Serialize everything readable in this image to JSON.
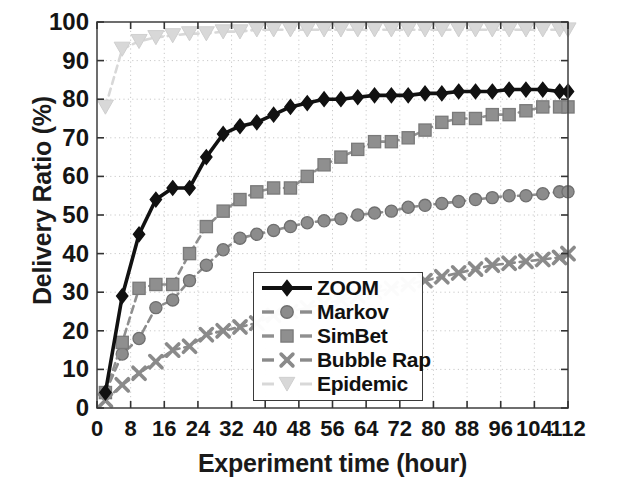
{
  "chart_data": {
    "type": "line",
    "title": "",
    "xlabel": "Experiment time (hour)",
    "ylabel": "Delivery Ratio (%)",
    "xlim": [
      0,
      112
    ],
    "ylim": [
      0,
      100
    ],
    "xticks": [
      0,
      8,
      16,
      24,
      32,
      40,
      48,
      56,
      64,
      72,
      80,
      88,
      96,
      104,
      112
    ],
    "yticks": [
      0,
      10,
      20,
      30,
      40,
      50,
      60,
      70,
      80,
      90,
      100
    ],
    "grid": true,
    "grid_style": "dotted",
    "legend_position": "lower center",
    "x": [
      2,
      6,
      10,
      14,
      18,
      22,
      26,
      30,
      34,
      38,
      42,
      46,
      50,
      54,
      58,
      62,
      66,
      70,
      74,
      78,
      82,
      86,
      90,
      94,
      98,
      102,
      106,
      110,
      112
    ],
    "series": [
      {
        "name": "ZOOM",
        "color": "#111111",
        "marker": "diamond",
        "line": "solid",
        "values": [
          4,
          29,
          45,
          54,
          57,
          57,
          65,
          71,
          73,
          74,
          76,
          78,
          79,
          80,
          80,
          80.5,
          81,
          81,
          81,
          81.5,
          81.5,
          82,
          82,
          82,
          82.5,
          82.5,
          82.5,
          82,
          82
        ]
      },
      {
        "name": "Markov",
        "color": "#8c8c8c",
        "marker": "circle",
        "line": "dashed",
        "values": [
          4,
          14,
          18,
          26,
          28,
          33,
          37,
          41,
          44,
          45,
          46,
          47,
          48,
          48.5,
          49,
          50,
          50.5,
          51,
          52,
          52.5,
          53,
          53.5,
          54,
          54.5,
          55,
          55,
          55.5,
          56,
          56
        ]
      },
      {
        "name": "SimBet",
        "color": "#8f8f8f",
        "marker": "square",
        "line": "dashed",
        "values": [
          4,
          17,
          31,
          32,
          32,
          40,
          47,
          51,
          54,
          56,
          57,
          57,
          60,
          63,
          65,
          67,
          69,
          69,
          70,
          72,
          74,
          75,
          75,
          76,
          76,
          77,
          78,
          78,
          78
        ]
      },
      {
        "name": "Bubble Rap",
        "color": "#8a8a8a",
        "marker": "x",
        "line": "dashed",
        "values": [
          2,
          6,
          9,
          12,
          15,
          16,
          19,
          20,
          21,
          22,
          24,
          25,
          26,
          27,
          28,
          29,
          30,
          31,
          32,
          33,
          34,
          35,
          36,
          37,
          37.5,
          38,
          38.5,
          39,
          40
        ]
      },
      {
        "name": "Epidemic",
        "color": "#d8d8d8",
        "marker": "triangle-down",
        "line": "dashed",
        "values": [
          78,
          93,
          95,
          96,
          96.5,
          97,
          97,
          97.5,
          97.5,
          98,
          98,
          98,
          98,
          98,
          98,
          98,
          98,
          98,
          98,
          98,
          98,
          98,
          98,
          98,
          98,
          98,
          98,
          98,
          98
        ]
      }
    ]
  },
  "legend": {
    "items": [
      {
        "label": "ZOOM"
      },
      {
        "label": "Markov"
      },
      {
        "label": "SimBet"
      },
      {
        "label": "Bubble Rap"
      },
      {
        "label": "Epidemic"
      }
    ]
  }
}
